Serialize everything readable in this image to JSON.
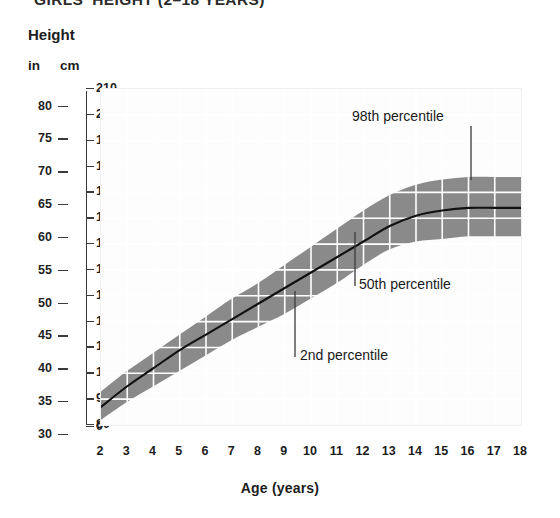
{
  "title": "GIRLS' HEIGHT (2–18 YEARS)",
  "axes": {
    "height_heading": "Height",
    "unit_in": "in",
    "unit_cm": "cm",
    "x_title": "Age (years)",
    "in_ticks": [
      "80",
      "75",
      "70",
      "65",
      "60",
      "55",
      "50",
      "45",
      "40",
      "35",
      "30"
    ],
    "cm_ticks": [
      "210",
      "200",
      "190",
      "180",
      "170",
      "160",
      "150",
      "140",
      "130",
      "120",
      "110",
      "100",
      "90",
      "80",
      "0"
    ],
    "x_ticks": [
      "2",
      "3",
      "4",
      "5",
      "6",
      "7",
      "8",
      "9",
      "10",
      "11",
      "12",
      "13",
      "14",
      "15",
      "16",
      "17",
      "18"
    ]
  },
  "annotations": {
    "p98": "98th percentile",
    "p50": "50th percentile",
    "p02": "2nd percentile"
  },
  "colors": {
    "band": "#8a8a8a",
    "median_line": "#111111",
    "gridline": "#ffffff",
    "plot_background": "#fdfdfd",
    "text": "#1c1c1c"
  },
  "chart_data": {
    "type": "area",
    "title": "GIRLS' HEIGHT (2–18 YEARS)",
    "xlabel": "Age (years)",
    "ylabel": "Height",
    "y_unit_primary": "cm",
    "y_unit_secondary": "in",
    "xlim": [
      2,
      18
    ],
    "ylim_cm": [
      80,
      210
    ],
    "ylim_in": [
      30,
      80
    ],
    "grid": true,
    "legend": "annotated inline",
    "x": [
      2,
      3,
      4,
      5,
      6,
      7,
      8,
      9,
      10,
      11,
      12,
      13,
      14,
      15,
      16,
      17,
      18
    ],
    "series": [
      {
        "name": "2nd percentile",
        "unit": "cm",
        "values": [
          82,
          89,
          95,
          101,
          107,
          113,
          118,
          123,
          129,
          135,
          142,
          148,
          151,
          152,
          153,
          153,
          153
        ]
      },
      {
        "name": "50th percentile",
        "unit": "cm",
        "values": [
          87,
          95,
          102,
          109,
          115,
          121,
          127,
          133,
          139,
          145,
          151,
          157,
          161,
          163,
          164,
          164,
          164
        ]
      },
      {
        "name": "98th percentile",
        "unit": "cm",
        "values": [
          93,
          101,
          108,
          115,
          122,
          129,
          135,
          142,
          149,
          156,
          163,
          169,
          173,
          175,
          176,
          176,
          176
        ]
      }
    ]
  }
}
